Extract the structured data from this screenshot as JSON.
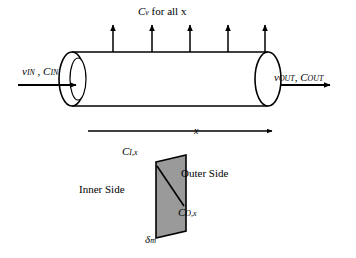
{
  "figure": {
    "background_color": "#ffffff",
    "line_color": "#000000",
    "membrane_fill": "#9a9a9a"
  },
  "labels": {
    "permeate_flux": "Cᵥ for all x",
    "permeate_flux_parts": {
      "main": "C",
      "sub": "v",
      "rest": " for all x"
    },
    "inlet": "v₁ₙ , C₁ₙ",
    "inlet_parts": {
      "v": "v",
      "v_sub": "IN",
      "c": "C",
      "c_sub": "IN"
    },
    "outlet_parts": {
      "v": "v",
      "v_sub": "OUT",
      "c": "C",
      "c_sub": "OUT"
    },
    "axial_coordinate": "x",
    "inner_concentration": {
      "main": "C",
      "sub": "I,x"
    },
    "outer_concentration": {
      "main": "C",
      "sub": "O,x"
    },
    "inner_side": "Inner Side",
    "outer_side": "Outer Side",
    "membrane_thickness": {
      "main": "δ",
      "sub": "m"
    }
  },
  "geometry": {
    "tube": {
      "left_ellipse_cx": 72,
      "left_ellipse_cy": 79,
      "right_ellipse_cx": 268,
      "right_ellipse_cy": 79,
      "ellipse_rx": 13,
      "ellipse_ry": 27
    },
    "flux_arrow_count": 5,
    "flux_arrow_x": [
      113,
      152,
      190,
      228,
      265
    ]
  }
}
